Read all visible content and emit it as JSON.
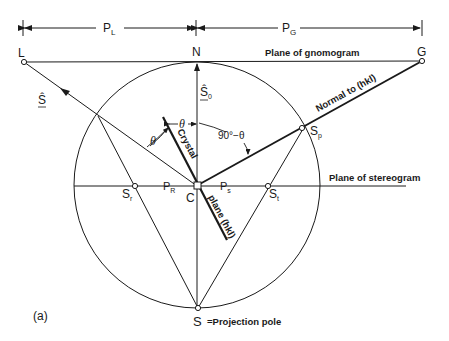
{
  "figure": {
    "panel_label": "(a)",
    "dimensions": {
      "left_label": "P",
      "left_sub": "L",
      "right_label": "P",
      "right_sub": "G"
    },
    "points": {
      "L": "L",
      "N": "N",
      "G": "G",
      "C": "C",
      "S": "S",
      "Sr": "S",
      "Sr_sub": "r",
      "St": "S",
      "St_sub": "t",
      "Sp": "S",
      "Sp_sub": "p",
      "PR": "P",
      "PR_sub": "R",
      "Ps": "P",
      "Ps_sub": "s"
    },
    "vectors": {
      "s_hat": "Ŝ",
      "s0_hat": "Ŝ",
      "s0_sub": "0"
    },
    "angles": {
      "theta1": "θ",
      "theta2": "θ",
      "ninety_minus_theta": "90°−θ"
    },
    "labels": {
      "plane_gnomogram": "Plane of gnomogram",
      "plane_stereogram": "Plane of stereogram",
      "normal": "Normal to (hkl)",
      "crystal": "Crystal",
      "plane_hkl": "plane (hkl)",
      "projection_pole": "=Projection pole"
    },
    "colors": {
      "ink": "#1a1a1a",
      "background": "#ffffff"
    }
  }
}
